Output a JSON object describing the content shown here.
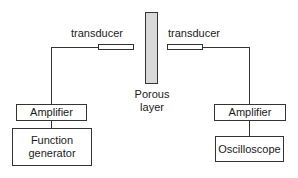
{
  "diagram": {
    "left": {
      "transducer_label": "transducer",
      "amplifier_label": "Amplifier",
      "source_label_line1": "Function",
      "source_label_line2": "generator"
    },
    "center": {
      "porous_label_line1": "Porous",
      "porous_label_line2": "layer"
    },
    "right": {
      "transducer_label": "transducer",
      "amplifier_label": "Amplifier",
      "receiver_label": "Oscilloscope"
    },
    "colors": {
      "line": "#333333",
      "porous_fill": "#d9d9d9",
      "background": "#ffffff"
    }
  }
}
